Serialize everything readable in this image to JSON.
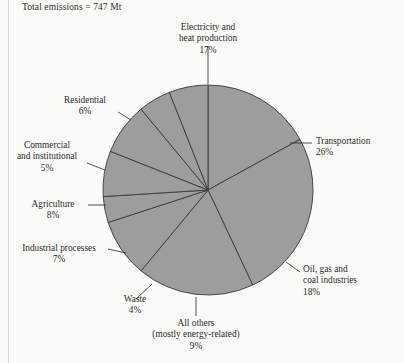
{
  "figure": {
    "total_label": "Total emissions = 747 Mt",
    "background_color": "#fbfbf9",
    "slice_fill_color": "#9d9d9d",
    "slice_stroke_color": "#3a3a3a",
    "text_color": "#2b2b2b"
  },
  "chart_data": {
    "type": "pie",
    "title": "Total emissions = 747 Mt",
    "total": 747,
    "units": "Mt",
    "legend": "none",
    "labels_position": "outside-with-leader-lines",
    "start_angle_deg": 0,
    "direction": "clockwise",
    "categories": [
      "Electricity and heat production",
      "Transportation",
      "Oil, gas and coal industries",
      "All others (mostly energy-related)",
      "Waste",
      "Industrial processes",
      "Agriculture",
      "Commercial and institutional",
      "Residential"
    ],
    "values": [
      17,
      26,
      18,
      9,
      4,
      7,
      8,
      5,
      6
    ],
    "value_labels": [
      "17%",
      "26%",
      "18%",
      "9%",
      "4%",
      "7%",
      "8%",
      "5%",
      "6%"
    ],
    "slices": [
      {
        "name": "Electricity and heat production",
        "label_line1": "Electricity and",
        "label_line2": "heat production",
        "value": 17,
        "value_label": "17%"
      },
      {
        "name": "Transportation",
        "label_line1": "Transportation",
        "label_line2": "",
        "value": 26,
        "value_label": "26%"
      },
      {
        "name": "Oil, gas and coal industries",
        "label_line1": "Oil, gas and",
        "label_line2": "coal industries",
        "value": 18,
        "value_label": "18%"
      },
      {
        "name": "All others (mostly energy-related)",
        "label_line1": "All others",
        "label_line2": "(mostly energy-related)",
        "value": 9,
        "value_label": "9%"
      },
      {
        "name": "Waste",
        "label_line1": "Waste",
        "label_line2": "",
        "value": 4,
        "value_label": "4%"
      },
      {
        "name": "Industrial processes",
        "label_line1": "Industrial processes",
        "label_line2": "",
        "value": 7,
        "value_label": "7%"
      },
      {
        "name": "Agriculture",
        "label_line1": "Agriculture",
        "label_line2": "",
        "value": 8,
        "value_label": "8%"
      },
      {
        "name": "Commercial and institutional",
        "label_line1": "Commercial",
        "label_line2": "and institutional",
        "value": 5,
        "value_label": "5%"
      },
      {
        "name": "Residential",
        "label_line1": "Residential",
        "label_line2": "",
        "value": 6,
        "value_label": "6%"
      }
    ]
  }
}
